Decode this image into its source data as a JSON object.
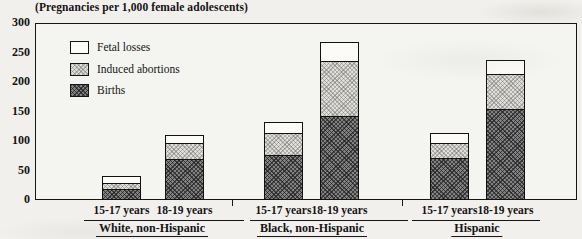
{
  "figure": {
    "title": "(Pregnancies per 1,000 female adolescents)"
  },
  "legend": {
    "items": [
      {
        "key": "fetal_losses",
        "label": "Fetal losses"
      },
      {
        "key": "induced_abortions",
        "label": "Induced abortions"
      },
      {
        "key": "births",
        "label": "Births"
      }
    ]
  },
  "colors": {
    "paper": "#f1f0ec",
    "line": "#161616",
    "births_fill": "#828282",
    "induced_abortions_fill": "#e0ded9",
    "fetal_losses_fill": "#fcfbf8"
  },
  "chart_data": {
    "type": "bar",
    "stacked": true,
    "title": "(Pregnancies per 1,000 female adolescents)",
    "ylabel": "Pregnancies per 1,000 female adolescents",
    "ylim": [
      0,
      300
    ],
    "yticks": [
      0,
      50,
      100,
      150,
      200,
      250,
      300
    ],
    "grid": false,
    "legend_position": "top-left-inside",
    "series_order_bottom_to_top": [
      "births",
      "induced_abortions",
      "fetal_losses"
    ],
    "groups": [
      {
        "label": "White, non-Hispanic",
        "bars": [
          {
            "age": "15-17 years",
            "births": 19,
            "induced_abortions": 10,
            "fetal_losses": 11,
            "total": 40
          },
          {
            "age": "18-19 years",
            "births": 70,
            "induced_abortions": 28,
            "fetal_losses": 13,
            "total": 111
          }
        ]
      },
      {
        "label": "Black, non-Hispanic",
        "bars": [
          {
            "age": "15-17 years",
            "births": 77,
            "induced_abortions": 38,
            "fetal_losses": 17,
            "total": 132
          },
          {
            "age": "18-19 years",
            "births": 142,
            "induced_abortions": 95,
            "fetal_losses": 31,
            "total": 268
          }
        ]
      },
      {
        "label": "Hispanic",
        "bars": [
          {
            "age": "15-17 years",
            "births": 72,
            "induced_abortions": 26,
            "fetal_losses": 15,
            "total": 113
          },
          {
            "age": "18-19 years",
            "births": 155,
            "induced_abortions": 60,
            "fetal_losses": 22,
            "total": 237
          }
        ]
      }
    ]
  }
}
